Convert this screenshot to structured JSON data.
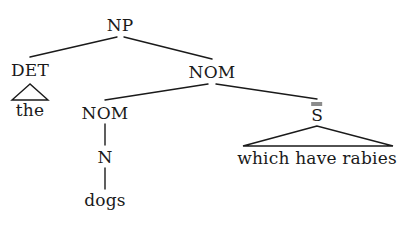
{
  "figure": {
    "type": "syntax-tree",
    "kind": "constituency tree (X-bar style) for an English relative-clause NP",
    "sentence": "the dogs which have rabies",
    "background_color": "#ffffff",
    "line_color": "#1a1a1a",
    "text_color": "#1a1a1a"
  },
  "nodes": {
    "np": {
      "label": "NP",
      "x": 120,
      "y": 25
    },
    "det": {
      "label": "DET",
      "x": 30,
      "y": 70
    },
    "the": {
      "label": "the",
      "x": 30,
      "y": 110
    },
    "nom_upper": {
      "label": "NOM",
      "x": 212,
      "y": 72
    },
    "nom_lower": {
      "label": "NOM",
      "x": 105,
      "y": 113
    },
    "n": {
      "label": "N",
      "x": 105,
      "y": 157
    },
    "dogs": {
      "label": "dogs",
      "x": 105,
      "y": 200
    },
    "sbar": {
      "label": "S",
      "bars": 2,
      "x": 317,
      "y": 113
    },
    "relative_clause": {
      "label": "which have rabies",
      "x": 317,
      "y": 158
    }
  },
  "edges": [
    {
      "name": "np-to-det",
      "from": "NP",
      "to": "DET",
      "x1": 117,
      "y1": 37,
      "x2": 30,
      "y2": 57
    },
    {
      "name": "np-to-nom",
      "from": "NP",
      "to": "NOM",
      "x1": 124,
      "y1": 37,
      "x2": 212,
      "y2": 59
    },
    {
      "name": "nom-to-nom",
      "from": "NOM",
      "to": "NOM",
      "x1": 208,
      "y1": 84,
      "x2": 105,
      "y2": 100
    },
    {
      "name": "nom-to-sbar",
      "from": "NOM",
      "to": "S",
      "x1": 216,
      "y1": 84,
      "x2": 317,
      "y2": 99
    },
    {
      "name": "nom-to-n",
      "from": "NOM",
      "to": "N",
      "x1": 105,
      "y1": 124,
      "x2": 105,
      "y2": 145
    },
    {
      "name": "n-to-dogs",
      "from": "N",
      "to": "dogs",
      "x1": 105,
      "y1": 168,
      "x2": 105,
      "y2": 189
    }
  ],
  "triangles": [
    {
      "name": "det-triangle",
      "under": "DET",
      "covers": "the",
      "apex_x": 30,
      "apex_y": 84,
      "left_x": 12,
      "right_x": 48,
      "base_y": 100
    },
    {
      "name": "sbar-triangle",
      "under": "S",
      "covers": "which have rabies",
      "apex_x": 317,
      "apex_y": 126,
      "left_x": 243,
      "right_x": 393,
      "base_y": 146
    }
  ]
}
